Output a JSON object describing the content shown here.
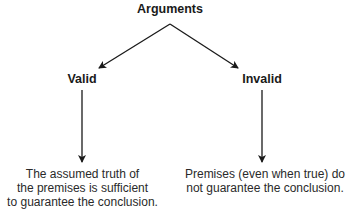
{
  "diagram": {
    "root": {
      "label": "Arguments"
    },
    "branches": [
      {
        "label": "Valid",
        "description_lines": [
          "The assumed truth of",
          "the premises is sufficient",
          "to guarantee the conclusion."
        ]
      },
      {
        "label": "Invalid",
        "description_lines": [
          "Premises (even when true) do",
          "not guarantee the conclusion."
        ]
      }
    ],
    "colors": {
      "line": "#1a1a1a",
      "text": "#1a1a1a"
    }
  }
}
